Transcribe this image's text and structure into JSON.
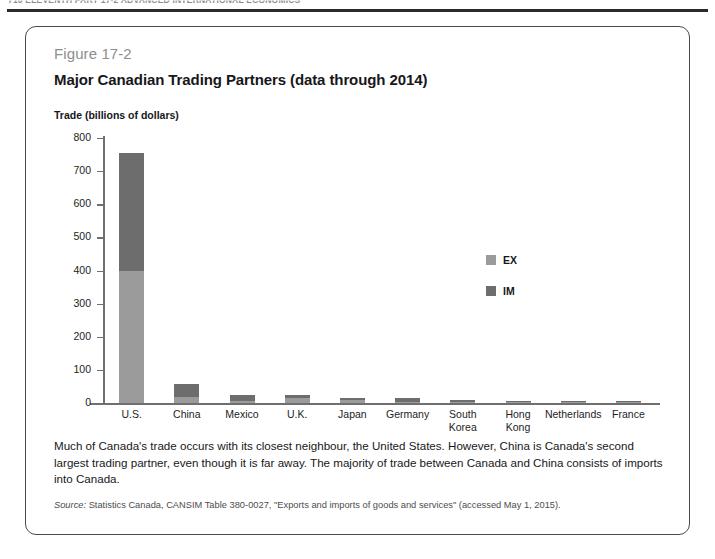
{
  "page": {
    "running_header": "710   ELEVENTH PART 17-2   ADVANCED INTERNATIONAL ECONOMICS"
  },
  "figure": {
    "number": "Figure 17-2",
    "title": "Major Canadian Trading Partners (data through 2014)",
    "caption": "Much of Canada's trade occurs with its closest neighbour, the United States. However, China is Canada's second largest trading partner, even though it is far away. The majority of trade between Canada and China consists of imports into Canada.",
    "source_word": "Source:",
    "source_text": " Statistics Canada, CANSIM Table 380-0027, \"Exports and imports of goods and services\"  (accessed May 1, 2015)."
  },
  "chart_data": {
    "type": "bar",
    "subtype": "stacked-bar",
    "title": "Major Canadian Trading Partners (data through 2014)",
    "xlabel": "",
    "ylabel": "Trade (billions of dollars)",
    "axis_title": "Trade (billions of dollars)",
    "ylim": [
      0,
      800
    ],
    "yticks": [
      0,
      100,
      200,
      300,
      400,
      500,
      600,
      700,
      800
    ],
    "ytick_labels": [
      "0",
      "100",
      "200",
      "300",
      "400",
      "500",
      "600",
      "700",
      "800"
    ],
    "grid": false,
    "legend_position": "inside-right",
    "categories": [
      "U.S.",
      "China",
      "Mexico",
      "U.K.",
      "Japan",
      "Germany",
      "South Korea",
      "Hong Kong",
      "Netherlands",
      "France"
    ],
    "category_labels": [
      [
        "U.S."
      ],
      [
        "China"
      ],
      [
        "Mexico"
      ],
      [
        "U.K."
      ],
      [
        "Japan"
      ],
      [
        "Germany"
      ],
      [
        "South",
        "Korea"
      ],
      [
        "Hong",
        "Kong"
      ],
      [
        "Netherlands"
      ],
      [
        "France"
      ]
    ],
    "series": [
      {
        "name": "EX",
        "label": "EX",
        "color": "#9b9b9b",
        "values": [
          400,
          19,
          5,
          14,
          10,
          4,
          4,
          3,
          3,
          3
        ]
      },
      {
        "name": "IM",
        "label": "IM",
        "color": "#6d6d6d",
        "values": [
          355,
          37,
          19,
          9,
          5,
          12,
          4,
          3,
          4,
          4
        ]
      }
    ],
    "totals": [
      755,
      56,
      24,
      23,
      15,
      16,
      8,
      6,
      7,
      7
    ]
  },
  "legend": {
    "items": [
      {
        "label": "EX",
        "color": "#9b9b9b",
        "swatch": "legend-swatch-ex"
      },
      {
        "label": "IM",
        "color": "#6d6d6d",
        "swatch": "legend-swatch-im"
      }
    ]
  },
  "colors": {
    "ex": "#9b9b9b",
    "im": "#6d6d6d",
    "axis": "#6f6f6f",
    "card_border": "#4a4a4a",
    "fig_number": "#8e8e8e",
    "text": "#17171a"
  }
}
